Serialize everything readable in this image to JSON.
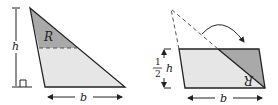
{
  "diagram": {
    "left": {
      "height_label": "h",
      "base_label": "b",
      "region_label": "R"
    },
    "right": {
      "height_num": "1",
      "height_den": "2",
      "height_var": "h",
      "base_label": "b",
      "region_label": "R"
    },
    "colors": {
      "light": "#e6e6e6",
      "dark": "#a9a9a9",
      "line": "#222222"
    }
  }
}
